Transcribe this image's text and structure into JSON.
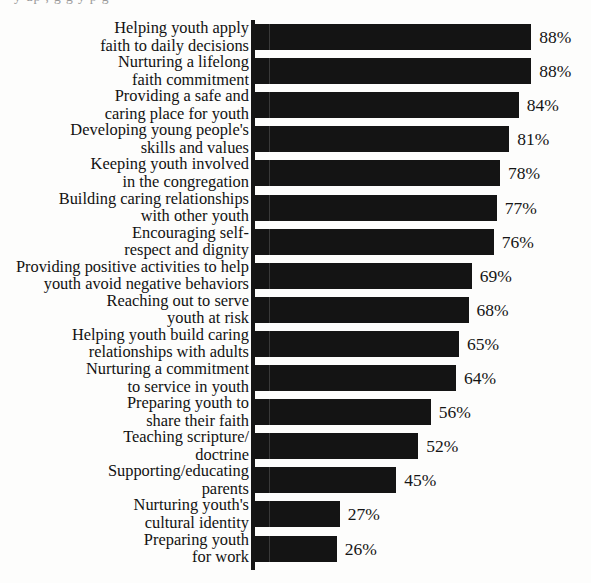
{
  "page": {
    "top_bleed_text": "y up        ,                        g  g       y    p g"
  },
  "chart_data": {
    "type": "bar",
    "orientation": "horizontal",
    "title": "",
    "subtitle": "",
    "xlabel": "",
    "ylabel": "",
    "xlim": [
      0,
      100
    ],
    "grid": false,
    "legend": null,
    "value_suffix": "%",
    "axis_color": "#141414",
    "bar_color": "#141414",
    "background_color": "#fdfdfc",
    "categories": [
      "Helping youth apply\nfaith to daily decisions",
      "Nurturing a lifelong\nfaith commitment",
      "Providing a safe and\ncaring place for youth",
      "Developing young people's\nskills and values",
      "Keeping youth involved\nin the congregation",
      "Building caring relationships\nwith other youth",
      "Encouraging self-\nrespect and dignity",
      "Providing positive activities to help\nyouth avoid negative behaviors",
      "Reaching out to serve\nyouth at risk",
      "Helping youth build caring\nrelationships with adults",
      "Nurturing a commitment\nto service in youth",
      "Preparing youth to\nshare their faith",
      "Teaching scripture/\ndoctrine",
      "Supporting/educating\nparents",
      "Nurturing youth's\ncultural identity",
      "Preparing youth\nfor work"
    ],
    "values": [
      88,
      88,
      84,
      81,
      78,
      77,
      76,
      69,
      68,
      65,
      64,
      56,
      52,
      45,
      27,
      26
    ],
    "value_labels": [
      "88%",
      "88%",
      "84%",
      "81%",
      "78%",
      "77%",
      "76%",
      "69%",
      "68%",
      "65%",
      "64%",
      "56%",
      "52%",
      "45%",
      "27%",
      "26%"
    ]
  }
}
